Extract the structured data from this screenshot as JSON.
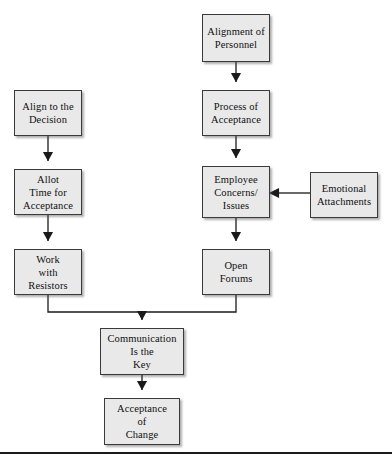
{
  "diagram": {
    "type": "flowchart",
    "title": "",
    "nodes": [
      {
        "id": "alignment-of-personnel",
        "label": "Alignment of\nPersonnel",
        "x": 202,
        "y": 14,
        "w": 68,
        "h": 48
      },
      {
        "id": "process-of-acceptance",
        "label": "Process of\nAcceptance",
        "x": 202,
        "y": 90,
        "w": 68,
        "h": 46
      },
      {
        "id": "employee-concerns-issues",
        "label": "Employee\nConcerns/\nIssues",
        "x": 202,
        "y": 166,
        "w": 68,
        "h": 52
      },
      {
        "id": "open-forums",
        "label": "Open\nForums",
        "x": 202,
        "y": 249,
        "w": 68,
        "h": 46
      },
      {
        "id": "align-to-the-decision",
        "label": "Align to the\nDecision",
        "x": 14,
        "y": 90,
        "w": 68,
        "h": 46
      },
      {
        "id": "allot-time-for-acceptance",
        "label": "Allot\nTime for\nAcceptance",
        "x": 14,
        "y": 169,
        "w": 68,
        "h": 46
      },
      {
        "id": "work-with-resistors",
        "label": "Work\nwith\nResistors",
        "x": 14,
        "y": 249,
        "w": 68,
        "h": 46
      },
      {
        "id": "emotional-attachments",
        "label": "Emotional\nAttachments",
        "x": 310,
        "y": 172,
        "w": 68,
        "h": 46
      },
      {
        "id": "communication-is-the-key",
        "label": "Communication\nIs the\nKey",
        "x": 100,
        "y": 328,
        "w": 84,
        "h": 47
      },
      {
        "id": "acceptance-of-change",
        "label": "Acceptance\nof\nChange",
        "x": 104,
        "y": 398,
        "w": 76,
        "h": 47
      }
    ],
    "edges": [
      {
        "from": "alignment-of-personnel",
        "to": "process-of-acceptance",
        "style": "vertical-arrow"
      },
      {
        "from": "process-of-acceptance",
        "to": "employee-concerns-issues",
        "style": "vertical-arrow"
      },
      {
        "from": "employee-concerns-issues",
        "to": "open-forums",
        "style": "vertical-arrow"
      },
      {
        "from": "align-to-the-decision",
        "to": "allot-time-for-acceptance",
        "style": "vertical-arrow"
      },
      {
        "from": "allot-time-for-acceptance",
        "to": "work-with-resistors",
        "style": "vertical-arrow"
      },
      {
        "from": "emotional-attachments",
        "to": "employee-concerns-issues",
        "style": "horizontal-arrow-left"
      },
      {
        "from": "work-with-resistors",
        "to": "communication-is-the-key",
        "style": "elbow-merge"
      },
      {
        "from": "open-forums",
        "to": "communication-is-the-key",
        "style": "elbow-merge"
      },
      {
        "from": "communication-is-the-key",
        "to": "acceptance-of-change",
        "style": "vertical-arrow"
      }
    ],
    "colors": {
      "node_fill": "#e9e9e9",
      "node_border": "#3a3a3a",
      "edge": "#1a1a1a",
      "background": "#ffffff"
    }
  },
  "footer": {
    "rule_label": "bottom-rule"
  }
}
